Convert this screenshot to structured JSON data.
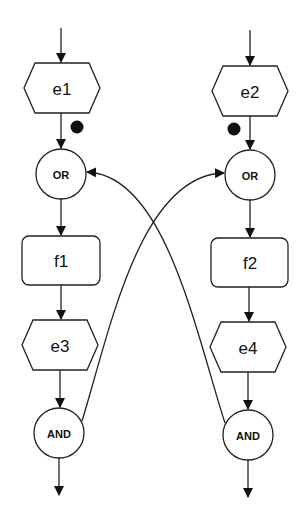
{
  "diagram": {
    "type": "event-driven process chain",
    "left_chain": {
      "event_in": "e1",
      "connector_in": "OR",
      "function": "f1",
      "event_out": "e3",
      "connector_out": "AND"
    },
    "right_chain": {
      "event_in": "e2",
      "connector_in": "OR",
      "function": "f2",
      "event_out": "e4",
      "connector_out": "AND"
    },
    "tokens": [
      {
        "position": "between e1 and OR",
        "color": "#000000"
      },
      {
        "position": "between e2 and OR",
        "color": "#000000"
      }
    ],
    "cross_edges": [
      {
        "from": "AND (left)",
        "to": "OR (right)"
      },
      {
        "from": "AND (right)",
        "to": "OR (left)"
      }
    ]
  }
}
